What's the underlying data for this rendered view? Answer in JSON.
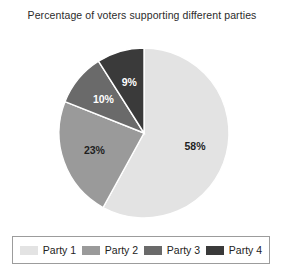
{
  "chart_data": {
    "type": "pie",
    "title": "Percentage of voters supporting different parties",
    "xlabel": "",
    "ylabel": "",
    "legend_position": "bottom",
    "grid": false,
    "start_angle_oclock": 12,
    "direction": "clockwise",
    "categories": [
      "Party 1",
      "Party 2",
      "Party 3",
      "Party 4"
    ],
    "values": [
      58,
      23,
      10,
      9
    ],
    "value_labels": [
      "58%",
      "23%",
      "10%",
      "9%"
    ],
    "unit": "%",
    "colors": [
      "#e3e3e3",
      "#9a9a9a",
      "#6a6a6a",
      "#3a3a3a"
    ],
    "label_text_colors": [
      "#1f1f1f",
      "#1f1f1f",
      "#ffffff",
      "#ffffff"
    ],
    "slice_border_color": "#ffffff",
    "slices": [
      {
        "name": "Party 1",
        "value": 58,
        "label": "58%",
        "color": "#e3e3e3"
      },
      {
        "name": "Party 2",
        "value": 23,
        "label": "23%",
        "color": "#9a9a9a"
      },
      {
        "name": "Party 3",
        "value": 10,
        "label": "10%",
        "color": "#6a6a6a"
      },
      {
        "name": "Party 4",
        "value": 9,
        "label": "9%",
        "color": "#3a3a3a"
      }
    ]
  },
  "legend": {
    "items": [
      {
        "label": "Party 1",
        "color": "#e3e3e3"
      },
      {
        "label": "Party 2",
        "color": "#9a9a9a"
      },
      {
        "label": "Party 3",
        "color": "#6a6a6a"
      },
      {
        "label": "Party 4",
        "color": "#3a3a3a"
      }
    ]
  },
  "geometry": {
    "center_x": 144,
    "center_y": 133,
    "radius": 85,
    "label_radius_fraction": 0.62
  }
}
